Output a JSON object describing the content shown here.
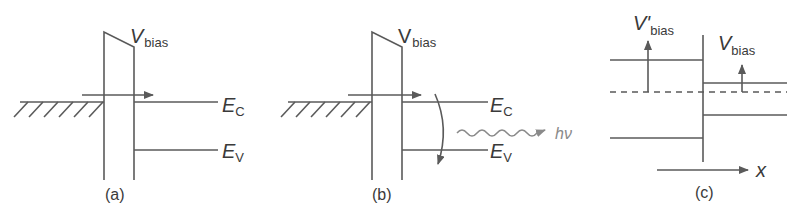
{
  "figure": {
    "panels": [
      {
        "id": "a",
        "caption": "(a)",
        "bias_label": "V",
        "bias_sub": "bias",
        "ec_label": "E",
        "ec_sub": "C",
        "ev_label": "E",
        "ev_sub": "V"
      },
      {
        "id": "b",
        "caption": "(b)",
        "bias_label": "V",
        "bias_sub": "bias",
        "ec_label": "E",
        "ec_sub": "C",
        "ev_label": "E",
        "ev_sub": "V",
        "photon_label": "hν"
      },
      {
        "id": "c",
        "caption": "(c)",
        "left_bias_label": "V'",
        "left_bias_sub": "bias",
        "right_bias_label": "V",
        "right_bias_sub": "bias",
        "axis_label": "x"
      }
    ],
    "colors": {
      "line": "#5a5a5a",
      "text": "#3a3a3a",
      "photon": "#8a8a8a"
    }
  }
}
